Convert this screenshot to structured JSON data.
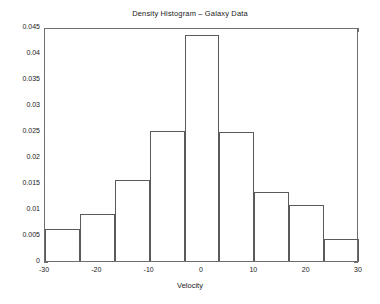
{
  "chart_data": {
    "type": "bar",
    "title": "Density Histogram – Galaxy Data",
    "xlabel": "Velocity",
    "ylabel": "",
    "xlim": [
      -30,
      30
    ],
    "ylim": [
      0,
      0.045
    ],
    "grid": false,
    "legend": null,
    "bin_edges": [
      -30,
      -23.333,
      -16.667,
      -10,
      -3.333,
      3.333,
      10,
      16.667,
      23.333,
      30
    ],
    "bin_width": 6.667,
    "categories": [
      "-30 to -23.3",
      "-23.3 to -16.7",
      "-16.7 to -10",
      "-10 to -3.3",
      "-3.3 to 3.3",
      "3.3 to 10",
      "10 to 16.7",
      "16.7 to 23.3",
      "23.3 to 30"
    ],
    "values": [
      0.0061,
      0.009,
      0.0155,
      0.025,
      0.0434,
      0.0249,
      0.0132,
      0.0108,
      0.0043
    ],
    "xticks": [
      -30,
      -20,
      -10,
      0,
      10,
      20,
      30
    ],
    "xtick_labels": [
      "-30",
      "-20",
      "-10",
      "0",
      "10",
      "20",
      "30"
    ],
    "yticks": [
      0,
      0.005,
      0.01,
      0.015,
      0.02,
      0.025,
      0.03,
      0.035,
      0.04,
      0.045
    ],
    "ytick_labels": [
      "0",
      "0.005",
      "0.01",
      "0.015",
      "0.02",
      "0.025",
      "0.03",
      "0.035",
      "0.04",
      "0.045"
    ],
    "colors": {
      "bar_edge": "#5a5a5a",
      "bar_fill": "none",
      "axis": "#6e6e6e",
      "text": "#1a1a1a",
      "background": "#ffffff"
    }
  }
}
